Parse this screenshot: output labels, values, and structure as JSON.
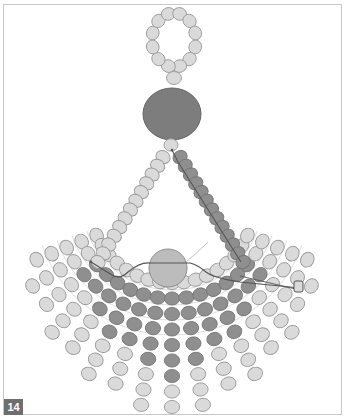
{
  "figure": {
    "step_number": "14",
    "colors": {
      "light_bead": "#dadada",
      "light_bead_stroke": "#9a9a9a",
      "dark_bead": "#8f8f8f",
      "dark_bead_stroke": "#777777",
      "large_oval_bead": "#7d7d7d",
      "round_center_bead": "#bcbcbc",
      "thread": "#555555",
      "thread_light": "#b5b5b5",
      "frame": "#c8c8c8",
      "badge_bg": "#6e6e6e",
      "badge_text": "#ffffff"
    },
    "elements": {
      "top_loop": {
        "cx": 174,
        "cy": 40,
        "rx": 22,
        "ry": 27,
        "bead_count": 12
      },
      "loop_base_bead": {
        "cx": 174,
        "cy": 78
      },
      "large_oval_bead": {
        "cx": 172,
        "cy": 114,
        "rx": 29,
        "ry": 26
      },
      "neck_bead": {
        "cx": 171,
        "cy": 145
      },
      "center_round_bead": {
        "cx": 168,
        "cy": 268,
        "r": 19
      },
      "left_strand": {
        "from": [
          163,
          157
        ],
        "to": [
          98,
          262
        ],
        "count": 13,
        "tone": "light"
      },
      "right_strand": {
        "from": [
          180,
          157
        ],
        "to": [
          243,
          262
        ],
        "count": 13,
        "tone": "dark"
      },
      "fan": {
        "center": [
          172,
          205
        ],
        "rays": 17,
        "start_angle_deg": 203,
        "end_angle_deg": 337
      }
    }
  }
}
